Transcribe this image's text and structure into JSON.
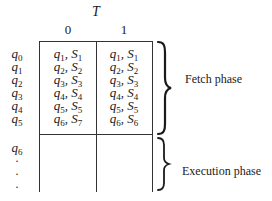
{
  "diagram": {
    "title": "T",
    "columns": [
      "0",
      "1"
    ],
    "fetch_rows": [
      {
        "state": "q",
        "state_sub": "0",
        "cells": [
          {
            "q": "q",
            "q_sub": "1",
            "s": "S",
            "s_sub": "1"
          },
          {
            "q": "q",
            "q_sub": "1",
            "s": "S",
            "s_sub": "1"
          }
        ]
      },
      {
        "state": "q",
        "state_sub": "1",
        "cells": [
          {
            "q": "q",
            "q_sub": "2",
            "s": "S",
            "s_sub": "2"
          },
          {
            "q": "q",
            "q_sub": "2",
            "s": "S",
            "s_sub": "2"
          }
        ]
      },
      {
        "state": "q",
        "state_sub": "2",
        "cells": [
          {
            "q": "q",
            "q_sub": "3",
            "s": "S",
            "s_sub": "3"
          },
          {
            "q": "q",
            "q_sub": "3",
            "s": "S",
            "s_sub": "3"
          }
        ]
      },
      {
        "state": "q",
        "state_sub": "3",
        "cells": [
          {
            "q": "q",
            "q_sub": "4",
            "s": "S",
            "s_sub": "4"
          },
          {
            "q": "q",
            "q_sub": "4",
            "s": "S",
            "s_sub": "4"
          }
        ]
      },
      {
        "state": "q",
        "state_sub": "4",
        "cells": [
          {
            "q": "q",
            "q_sub": "5",
            "s": "S",
            "s_sub": "5"
          },
          {
            "q": "q",
            "q_sub": "5",
            "s": "S",
            "s_sub": "5"
          }
        ]
      },
      {
        "state": "q",
        "state_sub": "5",
        "cells": [
          {
            "q": "q",
            "q_sub": "6",
            "s": "S",
            "s_sub": "7"
          },
          {
            "q": "q",
            "q_sub": "6",
            "s": "S",
            "s_sub": "6"
          }
        ]
      }
    ],
    "execution_rows": [
      {
        "state": "q",
        "state_sub": "6"
      }
    ],
    "ellipsis": [
      "·",
      "·",
      "·"
    ],
    "separator": ", ",
    "phases": {
      "fetch": "Fetch phase",
      "execution": "Execution phase"
    }
  }
}
